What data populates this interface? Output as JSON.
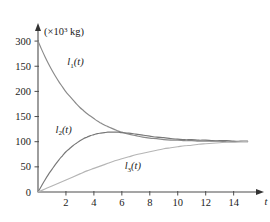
{
  "chart_data": {
    "type": "line",
    "title": "",
    "xlabel": "t",
    "ylabel": "",
    "y_unit_label": "(×10³ kg)",
    "y_unit_prefix": "(×10",
    "y_unit_exponent": "3",
    "y_unit_suffix": " kg)",
    "grid": false,
    "legend_position": "inline-annotations",
    "xlim": [
      0,
      15.6
    ],
    "ylim": [
      0,
      330
    ],
    "xticks": [
      0,
      2,
      4,
      6,
      8,
      10,
      12,
      14
    ],
    "xticklabels": [
      "0",
      "2",
      "4",
      "6",
      "8",
      "10",
      "12",
      "14"
    ],
    "yticks": [
      0,
      50,
      100,
      150,
      200,
      250,
      300
    ],
    "yticklabels": [
      "0",
      "50",
      "100",
      "150",
      "200",
      "150",
      "300"
    ],
    "axis_arrows": {
      "x": true,
      "y": true
    },
    "series": [
      {
        "name": "l₁(t)",
        "label_prefix": "l",
        "label_sub": "1",
        "label_suffix": "(t)",
        "color": "#8a8a8a",
        "label_x": 2.1,
        "label_y": 252,
        "x": [
          0,
          0.25,
          0.5,
          0.75,
          1,
          1.25,
          1.5,
          1.75,
          2,
          2.25,
          2.5,
          2.75,
          3,
          3.25,
          3.5,
          3.75,
          4,
          4.25,
          4.5,
          4.75,
          5,
          5.25,
          5.5,
          5.75,
          6,
          6.5,
          7,
          7.5,
          8,
          8.5,
          9,
          9.5,
          10,
          10.5,
          11,
          11.5,
          12,
          12.5,
          13,
          13.5,
          14,
          14.5,
          15
        ],
        "y": [
          300,
          284,
          269,
          255,
          242,
          230,
          219,
          209,
          199,
          191,
          183,
          175,
          168,
          162,
          156,
          151,
          146,
          141,
          137,
          133,
          130,
          127,
          124,
          121,
          119,
          115,
          112,
          109,
          107,
          106,
          104,
          103,
          103,
          102,
          102,
          101,
          101,
          101,
          101,
          100,
          100,
          100,
          100
        ]
      },
      {
        "name": "l₂(t)",
        "label_prefix": "l",
        "label_sub": "2",
        "label_suffix": "(t)",
        "color": "#787878",
        "label_x": 1.25,
        "label_y": 118,
        "x": [
          0,
          0.25,
          0.5,
          0.75,
          1,
          1.25,
          1.5,
          1.75,
          2,
          2.25,
          2.5,
          2.75,
          3,
          3.25,
          3.5,
          3.75,
          4,
          4.25,
          4.5,
          4.75,
          5,
          5.25,
          5.5,
          5.75,
          6,
          6.5,
          7,
          7.5,
          8,
          8.5,
          9,
          9.5,
          10,
          10.5,
          11,
          11.5,
          12,
          12.5,
          13,
          13.5,
          14,
          14.5,
          15
        ],
        "y": [
          0,
          12,
          24,
          35,
          45,
          55,
          64,
          72,
          80,
          86,
          92,
          97,
          102,
          106,
          109,
          112,
          114,
          116,
          117,
          118,
          119,
          119,
          119,
          119,
          118,
          117,
          115,
          113,
          111,
          109,
          108,
          106,
          105,
          104,
          104,
          103,
          103,
          102,
          102,
          102,
          101,
          101,
          101
        ]
      },
      {
        "name": "l₃(t)",
        "label_prefix": "l",
        "label_sub": "3",
        "label_suffix": "(t)",
        "color": "#b5b5b5",
        "label_x": 6.2,
        "label_y": 45,
        "x": [
          0,
          0.5,
          1,
          1.5,
          2,
          2.5,
          3,
          3.5,
          4,
          4.5,
          5,
          5.5,
          6,
          6.5,
          7,
          7.5,
          8,
          8.5,
          9,
          9.5,
          10,
          10.5,
          11,
          11.5,
          12,
          12.5,
          13,
          13.5,
          14,
          14.5,
          15
        ],
        "y": [
          0,
          6,
          12,
          18,
          24,
          30,
          36,
          42,
          47,
          52,
          57,
          62,
          66,
          70,
          74,
          77,
          80,
          83,
          86,
          88,
          90,
          92,
          93,
          95,
          96,
          97,
          98,
          99,
          99,
          100,
          100
        ]
      }
    ]
  }
}
